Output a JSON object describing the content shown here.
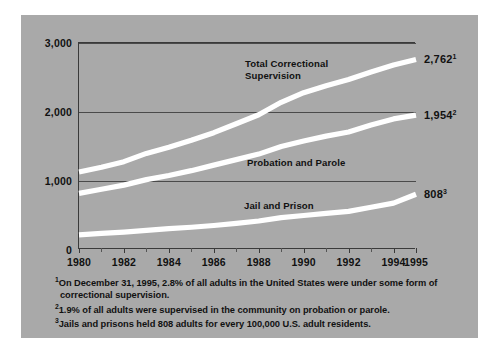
{
  "chart_data": {
    "type": "line",
    "title": "",
    "subtitle": "",
    "xlabel": "",
    "ylabel": "",
    "xlim": [
      1980,
      1995
    ],
    "ylim": [
      0,
      3000
    ],
    "grid": true,
    "legend_position": "inline-annotations",
    "y_ticks": [
      "0",
      "1,000",
      "2,000",
      "3,000"
    ],
    "y_tick_values": [
      0,
      1000,
      2000,
      3000
    ],
    "x_ticks": [
      "1980",
      "1982",
      "1984",
      "1986",
      "1988",
      "1990",
      "1992",
      "1994",
      "1995"
    ],
    "x_tick_values": [
      1980,
      1982,
      1984,
      1986,
      1988,
      1990,
      1992,
      1994,
      1995
    ],
    "x": [
      1980,
      1981,
      1982,
      1983,
      1984,
      1985,
      1986,
      1987,
      1988,
      1989,
      1990,
      1991,
      1992,
      1993,
      1994,
      1995
    ],
    "series": [
      {
        "name": "Total Correctional Supervision",
        "label": "Total Correctional\nSupervision",
        "end_value": "2,762",
        "end_footnote": "1",
        "color": "#ffffff",
        "values": [
          1130,
          1200,
          1280,
          1400,
          1490,
          1590,
          1700,
          1830,
          1960,
          2140,
          2280,
          2380,
          2470,
          2580,
          2680,
          2762
        ]
      },
      {
        "name": "Probation and Parole",
        "label": "Probation and Parole",
        "end_value": "1,954",
        "end_footnote": "2",
        "color": "#ffffff",
        "values": [
          820,
          880,
          940,
          1020,
          1080,
          1150,
          1230,
          1310,
          1390,
          1500,
          1580,
          1650,
          1710,
          1810,
          1900,
          1954
        ]
      },
      {
        "name": "Jail and Prison",
        "label": "Jail and Prison",
        "end_value": "808",
        "end_footnote": "3",
        "color": "#ffffff",
        "values": [
          220,
          240,
          260,
          285,
          310,
          330,
          355,
          385,
          420,
          470,
          500,
          530,
          560,
          620,
          680,
          808
        ]
      }
    ],
    "annotations": [
      "Total Correctional Supervision",
      "Probation and Parole",
      "Jail and Prison"
    ]
  },
  "footnotes": [
    {
      "marker": "1",
      "line1": "On December 31, 1995, 2.8% of all adults in the United States were under some form of",
      "line2": "correctional supervision."
    },
    {
      "marker": "2",
      "line1": "1.9% of all adults were supervised in the community on probation or parole.",
      "line2": ""
    },
    {
      "marker": "3",
      "line1": "Jails and prisons held 808 adults for every 100,000 U.S. adult residents.",
      "line2": ""
    }
  ],
  "colors": {
    "panel_background": "#a9a9a9",
    "page_background": "#ffffff",
    "axis": "#3a3a3a",
    "gridline": "#4a4a4a",
    "line": "#ffffff",
    "text": "#111111"
  }
}
